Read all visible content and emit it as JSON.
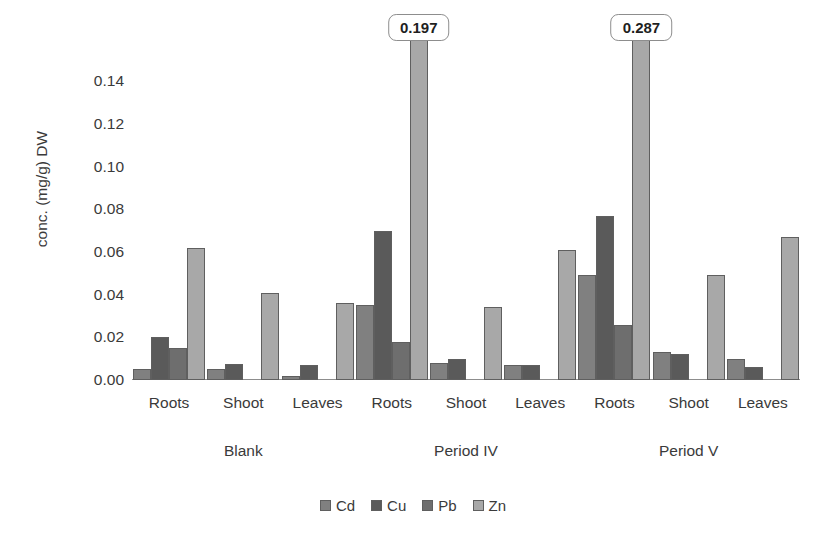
{
  "chart_data": {
    "type": "bar",
    "title": "",
    "xlabel": "",
    "ylabel": "conc. (mg/g) DW",
    "ylim": [
      0,
      0.15
    ],
    "y_ticks": [
      "0.00",
      "0.02",
      "0.04",
      "0.06",
      "0.08",
      "0.10",
      "0.12",
      "0.14"
    ],
    "y_tick_values": [
      0.0,
      0.02,
      0.04,
      0.06,
      0.08,
      0.1,
      0.12,
      0.14
    ],
    "grid": false,
    "legend_position": "bottom",
    "axis_clipped": true,
    "categories": [
      "Roots",
      "Shoot",
      "Leaves",
      "Roots",
      "Shoot",
      "Leaves",
      "Roots",
      "Shoot",
      "Leaves"
    ],
    "groups": [
      {
        "label": "Blank",
        "subgroups": [
          {
            "label": "Roots",
            "values": [
              0.005,
              0.02,
              0.015,
              0.062
            ]
          },
          {
            "label": "Shoot",
            "values": [
              0.005,
              0.0075,
              0.0,
              0.041
            ]
          },
          {
            "label": "Leaves",
            "values": [
              0.002,
              0.007,
              0.0,
              0.036
            ]
          }
        ]
      },
      {
        "label": "Period IV",
        "subgroups": [
          {
            "label": "Roots",
            "values": [
              0.035,
              0.07,
              0.018,
              0.197
            ],
            "callout": "0.197",
            "callout_series": 3
          },
          {
            "label": "Shoot",
            "values": [
              0.008,
              0.01,
              0.0,
              0.034
            ]
          },
          {
            "label": "Leaves",
            "values": [
              0.007,
              0.007,
              0.0,
              0.061
            ]
          }
        ]
      },
      {
        "label": "Period V",
        "subgroups": [
          {
            "label": "Roots",
            "values": [
              0.049,
              0.077,
              0.026,
              0.287
            ],
            "callout": "0.287",
            "callout_series": 3
          },
          {
            "label": "Shoot",
            "values": [
              0.013,
              0.012,
              0.0,
              0.049
            ]
          },
          {
            "label": "Leaves",
            "values": [
              0.01,
              0.006,
              0.0,
              0.067
            ]
          }
        ]
      }
    ],
    "series": [
      {
        "name": "Cd",
        "color": "#808080",
        "values": [
          0.005,
          0.005,
          0.002,
          0.035,
          0.008,
          0.007,
          0.049,
          0.013,
          0.01
        ]
      },
      {
        "name": "Cu",
        "color": "#5a5a5a",
        "values": [
          0.02,
          0.0075,
          0.007,
          0.07,
          0.01,
          0.007,
          0.077,
          0.012,
          0.006
        ]
      },
      {
        "name": "Pb",
        "color": "#6e6e6e",
        "values": [
          0.015,
          0.0,
          0.0,
          0.018,
          0.0,
          0.0,
          0.026,
          0.0,
          0.0
        ]
      },
      {
        "name": "Zn",
        "color": "#a8a8a8",
        "values": [
          0.062,
          0.041,
          0.036,
          0.197,
          0.034,
          0.061,
          0.287,
          0.049,
          0.067
        ]
      }
    ],
    "legend": [
      {
        "label": "Cd",
        "color": "#808080"
      },
      {
        "label": "Cu",
        "color": "#5a5a5a"
      },
      {
        "label": "Pb",
        "color": "#6e6e6e"
      },
      {
        "label": "Zn",
        "color": "#a8a8a8"
      }
    ],
    "annotations": [
      {
        "text": "0.197",
        "group": "Period IV",
        "subgroup": "Roots",
        "series": "Zn"
      },
      {
        "text": "0.287",
        "group": "Period V",
        "subgroup": "Roots",
        "series": "Zn"
      }
    ]
  }
}
